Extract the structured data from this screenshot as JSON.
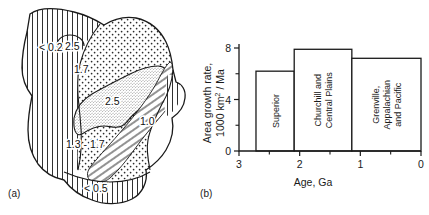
{
  "figure": {
    "panels": [
      {
        "id": "a",
        "caption": "(a)",
        "type": "map"
      },
      {
        "id": "b",
        "caption": "(b)",
        "type": "chart"
      }
    ]
  },
  "map": {
    "title": "",
    "regions": [
      {
        "name": "western-cordillera",
        "label": "< 0.2",
        "pattern": "vertical-lines"
      },
      {
        "name": "superior-arrow",
        "label": "2.5",
        "pattern": "coarse-stipple"
      },
      {
        "name": "central-plains",
        "label": "1.7",
        "pattern": "coarse-stipple"
      },
      {
        "name": "superior-province",
        "label": "2.5",
        "pattern": "fine-stipple"
      },
      {
        "name": "southern-province",
        "label": "1.3 - 1.7",
        "pattern": "coarse-stipple"
      },
      {
        "name": "grenville-province",
        "label": "1.0",
        "pattern": "diagonal-lines"
      },
      {
        "name": "appalachian-coastal",
        "label": "< 0.5",
        "pattern": "vertical-lines"
      }
    ]
  },
  "chart_data": {
    "type": "bar",
    "title": "",
    "xlabel": "Age, Ga",
    "ylabel": "Area growth rate,\n1000 km² / Ma",
    "ylabel_line1": "Area growth rate,",
    "ylabel_line2": "1000 km",
    "ylabel_line2_sup": "2",
    "ylabel_line2_tail": " / Ma",
    "xlim": [
      3,
      0
    ],
    "ylim": [
      0,
      8
    ],
    "x_axis_reversed": true,
    "grid": false,
    "legend": false,
    "x_ticks_major": [
      3,
      2,
      1,
      0
    ],
    "x_tick_labels": [
      "3",
      "2",
      "1",
      "0"
    ],
    "x_ticks_minor": [
      2.5,
      1.5,
      0.5
    ],
    "y_ticks_major": [
      0,
      4,
      8
    ],
    "y_tick_labels": [
      "0",
      "4",
      "8"
    ],
    "y_ticks_minor": [
      2,
      6
    ],
    "bars": [
      {
        "label": "Superior",
        "label_lines": [
          "Superior"
        ],
        "x_start": 2.72,
        "x_end": 2.09,
        "value": 6.2
      },
      {
        "label": "Churchill and Central Plains",
        "label_lines": [
          "Churchill and",
          "Central Plains"
        ],
        "x_start": 2.09,
        "x_end": 1.14,
        "value": 7.9
      },
      {
        "label": "Grenville, Appalachian and Pacific",
        "label_lines": [
          "Grenville,",
          "Appalachian",
          "and Pacific"
        ],
        "x_start": 1.14,
        "x_end": 0.0,
        "value": 7.2
      }
    ],
    "categories": [
      "Superior",
      "Churchill and Central Plains",
      "Grenville, Appalachian and Pacific"
    ],
    "values": [
      6.2,
      7.9,
      7.2
    ]
  },
  "colors": {
    "ink": "#1a1a1a",
    "background": "#ffffff",
    "stipple": "#3a3a3a"
  }
}
